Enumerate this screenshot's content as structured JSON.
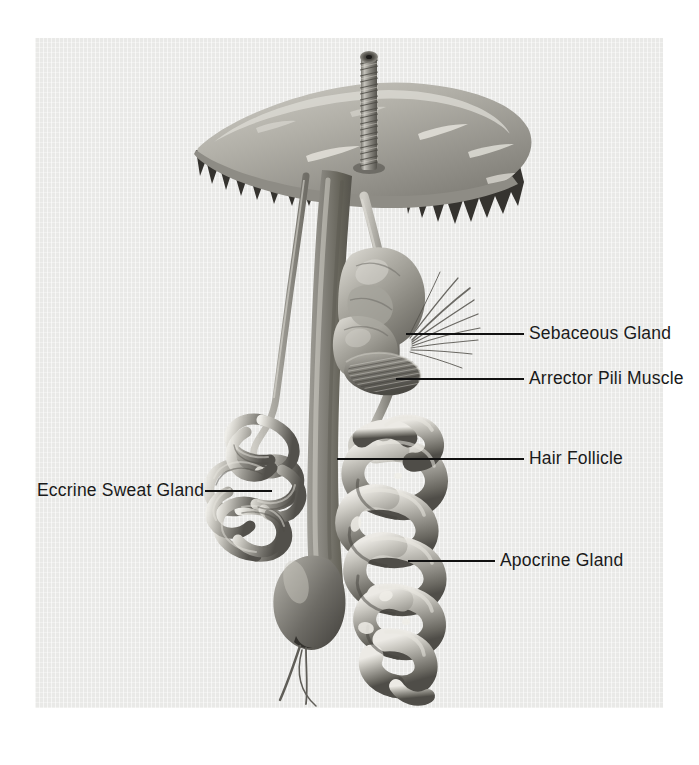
{
  "figure": {
    "panel": {
      "background_color": "#e9e9e7",
      "outer_background_color": "#ffffff"
    },
    "palette": {
      "tissue_light": "#d6d5d0",
      "tissue_mid": "#9a9892",
      "tissue_dark": "#6a6862",
      "tissue_shadow": "#4a4843",
      "epidermis_surface": "#a8a6a0",
      "junction_dark": "#35332f",
      "leader_line": "#111111",
      "label_text": "#1a1a1a"
    }
  },
  "labels": [
    {
      "id": "sebaceous-gland",
      "text": "Sebaceous Gland",
      "side": "right",
      "text_x": 529,
      "text_y": 325,
      "leader": {
        "x1": 406,
        "y1": 334,
        "x2": 524,
        "y2": 334
      }
    },
    {
      "id": "arrector-pili-muscle",
      "text": "Arrector Pili Muscle",
      "side": "right",
      "text_x": 529,
      "text_y": 370,
      "leader": {
        "x1": 396,
        "y1": 379,
        "x2": 524,
        "y2": 379
      }
    },
    {
      "id": "hair-follicle",
      "text": "Hair Follicle",
      "side": "right",
      "text_x": 529,
      "text_y": 450,
      "leader": {
        "x1": 337,
        "y1": 459,
        "x2": 524,
        "y2": 459
      }
    },
    {
      "id": "apocrine-gland",
      "text": "Apocrine Gland",
      "side": "right",
      "text_x": 500,
      "text_y": 552,
      "leader": {
        "x1": 408,
        "y1": 561,
        "x2": 495,
        "y2": 561
      }
    },
    {
      "id": "eccrine-sweat-gland",
      "text": "Eccrine Sweat Gland",
      "side": "left",
      "text_x": 37,
      "text_y": 482,
      "leader": {
        "x1": 205,
        "y1": 491,
        "x2": 272,
        "y2": 491
      }
    }
  ],
  "structures": [
    {
      "id": "hair-shaft",
      "name": "Hair shaft",
      "note": "Scaled cuticle texture, emerges above skin surface"
    },
    {
      "id": "epidermis",
      "name": "Epidermis",
      "note": "Curved surface sheet with skin creases"
    },
    {
      "id": "dermal-junction",
      "name": "Dermal-epidermal junction",
      "note": "Jagged dark rete ridge border"
    },
    {
      "id": "hair-follicle",
      "name": "Hair follicle",
      "note": "Long column descending to bulb"
    },
    {
      "id": "hair-bulb",
      "name": "Hair bulb",
      "note": "Bulbous base with nerve and vessel strands"
    },
    {
      "id": "sebaceous-gland",
      "name": "Sebaceous gland",
      "note": "Lobulated acini attached to follicle"
    },
    {
      "id": "arrector-pili",
      "name": "Arrector pili muscle",
      "note": "Striated oblique muscle band"
    },
    {
      "id": "eccrine-duct",
      "name": "Eccrine duct",
      "note": "Thin spiral duct from surface to coil"
    },
    {
      "id": "eccrine-coil",
      "name": "Eccrine secretory coil",
      "note": "Tight glomerulus of fine tubules"
    },
    {
      "id": "apocrine-duct",
      "name": "Apocrine duct",
      "note": "Arcs upward into upper follicle"
    },
    {
      "id": "apocrine-coil",
      "name": "Apocrine secretory coil",
      "note": "Large thick convoluted tubules"
    }
  ]
}
